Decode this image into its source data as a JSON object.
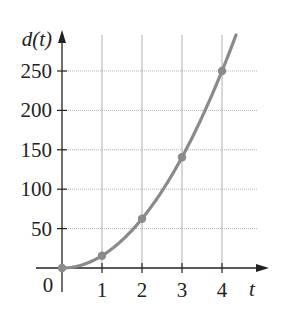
{
  "chart_data": {
    "type": "line",
    "title": "",
    "xlabel": "t",
    "ylabel": "d(t)",
    "x_ticks": [
      "0",
      "1",
      "2",
      "3",
      "4"
    ],
    "y_ticks": [
      "50",
      "100",
      "150",
      "200",
      "250"
    ],
    "origin_label": "0",
    "xlim": [
      0,
      4.4
    ],
    "ylim": [
      0,
      280
    ],
    "grid": true,
    "series": [
      {
        "name": "d(t)",
        "formula": "d(t) = 15.625 t^2",
        "x": [
          0,
          1,
          2,
          3,
          4
        ],
        "values": [
          0,
          15.6,
          62.5,
          140.6,
          250
        ],
        "marked_points": true
      }
    ],
    "curve_end_t": 4.35
  },
  "colors": {
    "curve": "#8a8a8a",
    "axis": "#222222",
    "grid": "#9a9a9a",
    "point": "#8a8a8a"
  }
}
